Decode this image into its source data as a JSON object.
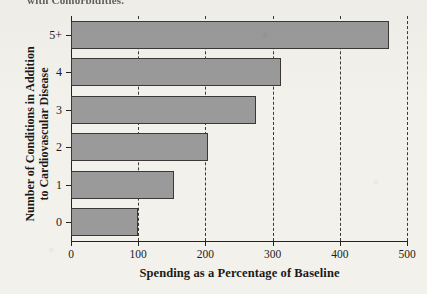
{
  "caption_top": "with Comorbidities.",
  "colors": {
    "page_background": "#f3f1ec",
    "bar_fill": "#9a9a9a",
    "bar_stroke": "#3b3835",
    "axis": "#25221f",
    "gridline": "#3a3734",
    "text": "#1b1917"
  },
  "chart_data": {
    "type": "bar",
    "orientation": "horizontal",
    "title": "",
    "xlabel": "Spending as a Percentage of Baseline",
    "ylabel_line1": "Number of Conditions in Addition",
    "ylabel_line2": "to Cardiovascular Disease",
    "categories": [
      "0",
      "1",
      "2",
      "3",
      "4",
      "5+"
    ],
    "values": [
      100,
      154,
      204,
      276,
      313,
      473
    ],
    "xlim": [
      0,
      500
    ],
    "xticks": [
      0,
      100,
      200,
      300,
      400,
      500
    ],
    "xticklabels": [
      "0",
      "100",
      "200",
      "300",
      "400",
      "500"
    ],
    "gridlines_x": [
      100,
      200,
      300,
      400,
      500
    ],
    "grid": true,
    "grid_style": "dashed",
    "legend": null,
    "legend_position": "none"
  }
}
